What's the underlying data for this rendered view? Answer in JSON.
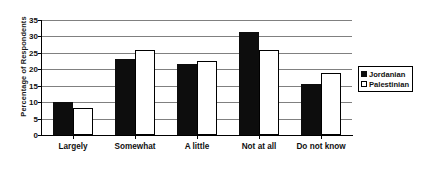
{
  "chart_data": {
    "type": "bar",
    "title": "",
    "xlabel": "",
    "ylabel": "Percentage of Respondents",
    "categories": [
      "Largely",
      "Somewhat",
      "A little",
      "Not at all",
      "Do not know"
    ],
    "series": [
      {
        "name": "Jordanian",
        "color": "#0d0d0d",
        "values": [
          10.0,
          23.0,
          21.5,
          31.5,
          15.5
        ]
      },
      {
        "name": "Palestinian",
        "color": "#ffffff",
        "values": [
          8.3,
          26.0,
          22.5,
          26.0,
          19.0
        ]
      }
    ],
    "ylim": [
      0,
      35
    ],
    "y_ticks": [
      0,
      5,
      10,
      15,
      20,
      25,
      30,
      35
    ],
    "y_tick_labels": [
      "0",
      "5",
      "10",
      "15",
      "20",
      "25",
      "30",
      "35"
    ],
    "grid": true,
    "legend_position": "right"
  },
  "legend": {
    "entries": [
      {
        "label": "Jordanian",
        "swatch": "filled-square"
      },
      {
        "label": "Palestinian",
        "swatch": "open-square"
      }
    ]
  }
}
